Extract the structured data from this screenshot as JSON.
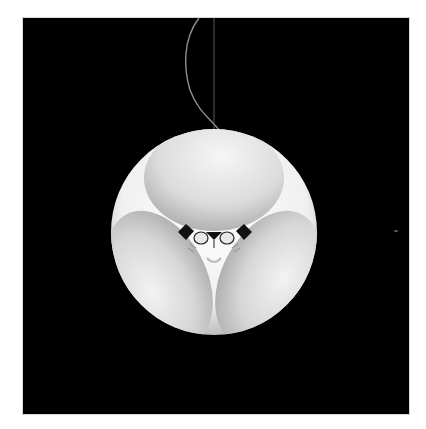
{
  "image": {
    "subject": "pendant-lamp",
    "description": "White spherical pendant lamp with three oval shade panels, suspended by a cord against a black background",
    "colors": {
      "background": "#000000",
      "frame": "#ffffff",
      "sphere_body": "#f2f2f2",
      "shade_light": "#eeeeee",
      "shade_shadow": "#a8a8a8",
      "cord": "#9a9a9a"
    },
    "geometry": {
      "sphere_center": [
        214,
        232
      ],
      "sphere_radius": 103,
      "top_shade": {
        "cx": 214,
        "cy": 178,
        "rx": 70,
        "ry": 52
      },
      "left_shade": {
        "cx": 158,
        "cy": 280,
        "rx": 45,
        "ry": 70,
        "rotate": -28
      },
      "right_shade": {
        "cx": 270,
        "cy": 280,
        "rx": 45,
        "ry": 70,
        "rotate": 28
      }
    }
  }
}
